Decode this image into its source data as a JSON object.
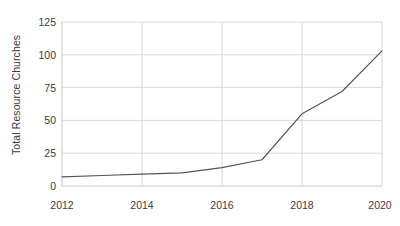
{
  "chart_data": {
    "type": "line",
    "title": "",
    "subtitle": "",
    "xlabel": "",
    "ylabel": "Total Resource Churches",
    "x": [
      2012,
      2013,
      2014,
      2015,
      2016,
      2017,
      2018,
      2019,
      2020
    ],
    "values": [
      7,
      8,
      9,
      10,
      14,
      20,
      55,
      72,
      103
    ],
    "series": [
      {
        "name": "Total Resource Churches",
        "values": [
          7,
          8,
          9,
          10,
          14,
          20,
          55,
          72,
          103
        ]
      }
    ],
    "xlim": [
      2012,
      2020
    ],
    "ylim": [
      0,
      125
    ],
    "xticks": [
      2012,
      2014,
      2016,
      2018,
      2020
    ],
    "xtick_labels": [
      "2012",
      "2014",
      "2016",
      "2018",
      "2020"
    ],
    "yticks": [
      0,
      25,
      50,
      75,
      100,
      125
    ],
    "ytick_labels": [
      "0",
      "25",
      "50",
      "75",
      "100",
      "125"
    ],
    "grid": true,
    "grid_axis": "both",
    "legend": false,
    "legend_position": "none",
    "line_color": "#555555",
    "line_width": 1.2,
    "markers": false,
    "grid_color": "#d9d9d9",
    "axis_color": "#cccccc",
    "background_color": "#ffffff",
    "text_color": "#3c3c3c"
  },
  "axis": {
    "y_title": "Total Resource Churches"
  }
}
